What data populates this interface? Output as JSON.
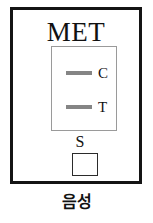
{
  "device": {
    "title": "MET",
    "title_meaning_shown": false
  },
  "result_window": {
    "bands": [
      {
        "id": "control",
        "label": "C",
        "present": true,
        "color": "#858585"
      },
      {
        "id": "test",
        "label": "T",
        "present": true,
        "color": "#858585"
      }
    ]
  },
  "sample_well": {
    "label": "S"
  },
  "caption": {
    "text": "음성"
  },
  "colors": {
    "outline": "#141414",
    "window_outline": "#9a9a9a",
    "band": "#858585",
    "well_outline": "#2b2b2b",
    "background": "#ffffff"
  }
}
